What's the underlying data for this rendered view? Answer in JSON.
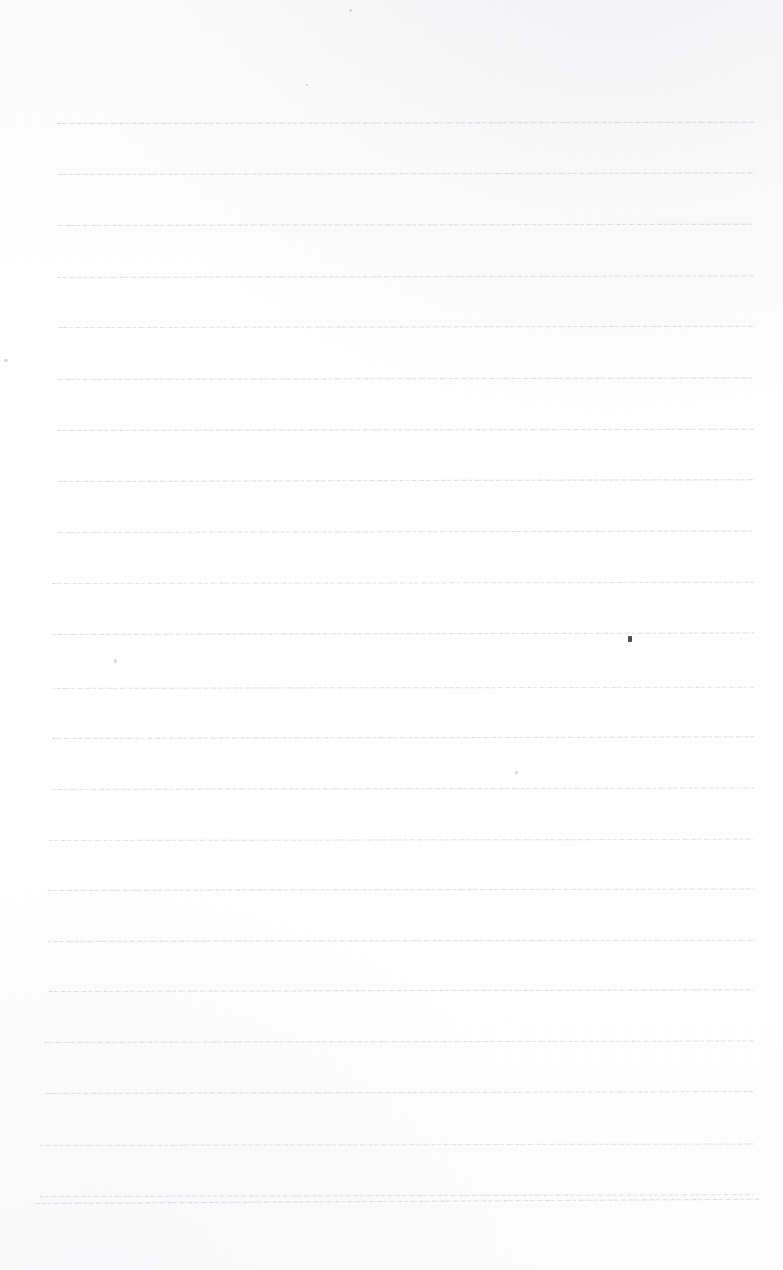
{
  "document": {
    "kind": "scanned-blank-ruled-page",
    "title": "Blank ruled notebook page (scan)",
    "page_width": 783,
    "page_height": 1270,
    "background_color": "#fdfdfe",
    "rule_color": "#b0b2be",
    "has_text": false,
    "text_content": "",
    "margin": {
      "top": 123,
      "bottom": 68,
      "left": 57,
      "right": 29
    },
    "ruling": {
      "line_count": 23,
      "first_line_y": 123,
      "line_spacing": 50.2,
      "line_left_x": 57,
      "line_right_x": 754,
      "skew_degrees": -0.12,
      "style": "faint broken single rule"
    }
  },
  "rules": [
    {
      "y": 123,
      "left": 57,
      "width": 697,
      "skew": -0.1,
      "opacity": 0.72
    },
    {
      "y": 174,
      "left": 57,
      "width": 697,
      "skew": -0.12,
      "opacity": 0.66
    },
    {
      "y": 225,
      "left": 57,
      "width": 697,
      "skew": -0.11,
      "opacity": 0.7
    },
    {
      "y": 277,
      "left": 57,
      "width": 697,
      "skew": -0.14,
      "opacity": 0.62
    },
    {
      "y": 327,
      "left": 57,
      "width": 697,
      "skew": -0.1,
      "opacity": 0.68
    },
    {
      "y": 379,
      "left": 57,
      "width": 697,
      "skew": -0.13,
      "opacity": 0.64
    },
    {
      "y": 430,
      "left": 57,
      "width": 697,
      "skew": -0.11,
      "opacity": 0.7
    },
    {
      "y": 481,
      "left": 57,
      "width": 697,
      "skew": -0.15,
      "opacity": 0.74
    },
    {
      "y": 532,
      "left": 57,
      "width": 697,
      "skew": -0.12,
      "opacity": 0.66
    },
    {
      "y": 583,
      "left": 52,
      "width": 702,
      "skew": -0.1,
      "opacity": 0.6
    },
    {
      "y": 634,
      "left": 52,
      "width": 702,
      "skew": -0.13,
      "opacity": 0.72
    },
    {
      "y": 688,
      "left": 52,
      "width": 702,
      "skew": -0.11,
      "opacity": 0.64
    },
    {
      "y": 738,
      "left": 52,
      "width": 702,
      "skew": -0.14,
      "opacity": 0.7
    },
    {
      "y": 789,
      "left": 52,
      "width": 702,
      "skew": -0.12,
      "opacity": 0.66
    },
    {
      "y": 840,
      "left": 48,
      "width": 706,
      "skew": -0.1,
      "opacity": 0.6
    },
    {
      "y": 890,
      "left": 48,
      "width": 706,
      "skew": -0.13,
      "opacity": 0.68
    },
    {
      "y": 941,
      "left": 48,
      "width": 706,
      "skew": -0.11,
      "opacity": 0.64
    },
    {
      "y": 991,
      "left": 48,
      "width": 706,
      "skew": -0.14,
      "opacity": 0.7
    },
    {
      "y": 1042,
      "left": 44,
      "width": 710,
      "skew": -0.12,
      "opacity": 0.62
    },
    {
      "y": 1093,
      "left": 44,
      "width": 710,
      "skew": -0.16,
      "opacity": 0.66
    },
    {
      "y": 1145,
      "left": 40,
      "width": 714,
      "skew": -0.13,
      "opacity": 0.58
    },
    {
      "y": 1196,
      "left": 40,
      "width": 714,
      "skew": -0.15,
      "opacity": 0.64
    },
    {
      "y": 1203,
      "left": 35,
      "width": 725,
      "skew": -0.34,
      "opacity": 0.7
    }
  ],
  "specks": [
    {
      "name": "ink-speck-dark",
      "x": 628,
      "y": 636,
      "w": 4,
      "h": 6,
      "kind": "dark"
    },
    {
      "name": "ink-speck-left",
      "x": 4,
      "y": 359,
      "w": 4,
      "h": 3,
      "kind": "faint"
    },
    {
      "name": "ink-speck-upper",
      "x": 114,
      "y": 659,
      "w": 3,
      "h": 4,
      "kind": "faint"
    },
    {
      "name": "ink-speck-middle",
      "x": 515,
      "y": 771,
      "w": 3,
      "h": 3,
      "kind": "faint"
    },
    {
      "name": "ink-speck-topright",
      "x": 349,
      "y": 9,
      "w": 3,
      "h": 3,
      "kind": "faint"
    },
    {
      "name": "ink-speck-corner",
      "x": 306,
      "y": 84,
      "w": 2,
      "h": 2,
      "kind": "faint"
    }
  ]
}
